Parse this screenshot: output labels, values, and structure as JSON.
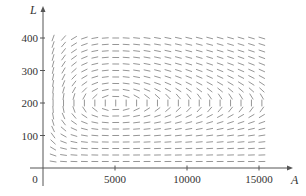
{
  "chart_data": {
    "type": "direction_field",
    "title": "",
    "xlabel": "A",
    "ylabel": "L",
    "origin_label": "0",
    "x_ticks": [
      5000,
      10000,
      15000
    ],
    "x_tick_labels": [
      "5000",
      "10000",
      "15000"
    ],
    "y_ticks": [
      100,
      200,
      300,
      400
    ],
    "y_tick_labels": [
      "100",
      "200",
      "300",
      "400"
    ],
    "xlim": [
      0,
      17000
    ],
    "ylim": [
      0,
      420
    ],
    "grid": false,
    "equations": {
      "dA_dt": "2A - 0.01AL",
      "dL_dt": "-0.5L + 0.0001AL",
      "slope": "dL/dA = L(-0.5 + 0.0001A) / (A(2 - 0.01L))"
    },
    "equilibrium": {
      "A": 5000,
      "L": 200
    },
    "field_grid": {
      "A_start": 700,
      "A_end": 15200,
      "A_step": 725,
      "L_start": 20,
      "L_end": 400,
      "L_step": 20
    },
    "segment_length_px": 6
  },
  "colors": {
    "axis": "#555555",
    "segment": "#8a8a8a",
    "text": "#333333"
  },
  "layout": {
    "origin_px": [
      43,
      168
    ],
    "px_per_A": 0.0144,
    "px_per_L": 0.325,
    "x_axis_end_px": 289,
    "y_axis_top_px": 10,
    "y_axis_bottom_px": 186,
    "x_axis_start_px": 30
  }
}
